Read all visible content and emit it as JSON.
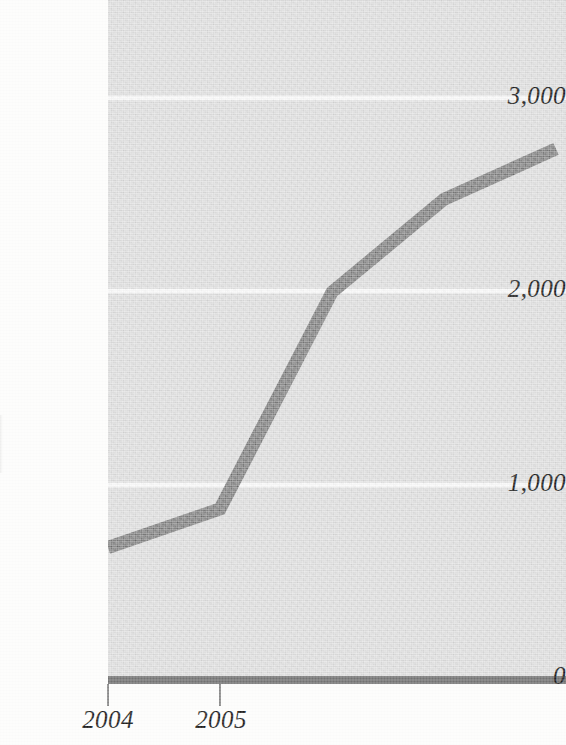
{
  "chart_data": {
    "type": "line",
    "title": "",
    "subtitle": "",
    "xlabel": "",
    "ylabel": "",
    "x": [
      2004,
      2005,
      2006,
      2007,
      2008
    ],
    "x_tick_labels": [
      "2004",
      "2005"
    ],
    "visible_x_tick_labels": [
      "2004",
      "2005"
    ],
    "y_tick_labels": [
      "0",
      "1,000",
      "2,000",
      "3,000"
    ],
    "y_tick_values": [
      0,
      1000,
      2000,
      3000
    ],
    "ylim": [
      0,
      3500
    ],
    "xlim": [
      2004,
      2008.1
    ],
    "grid": true,
    "grid_axis": "y",
    "grid_color": "#fbfbfb",
    "legend": false,
    "legend_position": "none",
    "plot_background": "#dcdcdc",
    "page_background": "#fdfdfc",
    "cropped": true,
    "series": [
      {
        "name": "series-1",
        "color": "#6f6f6f",
        "line_width_px": 13,
        "values": [
          700,
          900,
          2020,
          2500,
          2760
        ]
      }
    ],
    "annotations": []
  },
  "axes": {
    "y_ticks": [
      {
        "label": "3,000",
        "value": 3000
      },
      {
        "label": "2,000",
        "value": 2000
      },
      {
        "label": "1,000",
        "value": 1000
      },
      {
        "label": "0",
        "value": 0
      }
    ],
    "x_ticks": [
      {
        "label": "2004",
        "value": 2004
      },
      {
        "label": "2005",
        "value": 2005
      }
    ],
    "axis_color": "#737373",
    "tick_color": "#8a8a8a",
    "label_color": "#1b1b1b"
  }
}
